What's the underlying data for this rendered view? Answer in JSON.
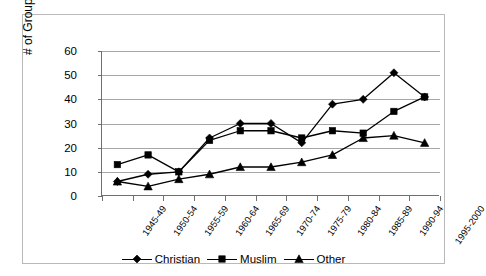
{
  "chart_data": {
    "type": "line",
    "title": "",
    "xlabel": "",
    "ylabel": "# of Groups Rebelling",
    "ylim": [
      0,
      60
    ],
    "yticks": [
      0,
      10,
      20,
      30,
      40,
      50,
      60
    ],
    "grid": true,
    "legend_position": "bottom",
    "categories": [
      "1945-49",
      "1950-54",
      "1955-59",
      "1960-64",
      "1965-69",
      "1970-74",
      "1975-79",
      "1980-84",
      "1985-89",
      "1990-94",
      "1995-2000"
    ],
    "series": [
      {
        "name": "Christian",
        "marker": "diamond",
        "color": "#000000",
        "values": [
          6,
          9,
          10,
          24,
          30,
          30,
          22,
          38,
          40,
          51,
          41
        ]
      },
      {
        "name": "Muslim",
        "marker": "square",
        "color": "#000000",
        "values": [
          13,
          17,
          10,
          23,
          27,
          27,
          24,
          27,
          26,
          35,
          41
        ]
      },
      {
        "name": "Other",
        "marker": "triangle",
        "color": "#000000",
        "values": [
          6,
          4,
          7,
          9,
          12,
          12,
          14,
          17,
          24,
          25,
          22
        ]
      }
    ]
  },
  "axes": {
    "y_title": "# of Groups Rebelling",
    "y_tick_labels": [
      "0",
      "10",
      "20",
      "30",
      "40",
      "50",
      "60"
    ],
    "x_tick_labels": [
      "1945-49",
      "1950-54",
      "1955-59",
      "1960-64",
      "1965-69",
      "1970-74",
      "1975-79",
      "1980-84",
      "1985-89",
      "1990-94",
      "1995-2000"
    ]
  },
  "legend": {
    "items": [
      {
        "label": "Christian",
        "marker": "diamond-marker-icon"
      },
      {
        "label": "Muslim",
        "marker": "square-marker-icon"
      },
      {
        "label": "Other",
        "marker": "triangle-marker-icon"
      }
    ]
  },
  "colors": {
    "series_line": "#000000",
    "gridline": "#a6a6a6",
    "axis": "#6f6f6f",
    "frame": "#b9b9b9",
    "background": "#ffffff"
  }
}
